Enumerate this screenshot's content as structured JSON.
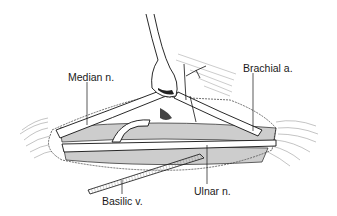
{
  "figure": {
    "type": "anatomical illustration",
    "style": "black-and-white line drawing",
    "labels": {
      "median_nerve": "Median n.",
      "brachial_artery": "Brachial a.",
      "basilic_vein": "Basilic v.",
      "ulnar_nerve": "Ulnar n."
    },
    "colors": {
      "background": "#ffffff",
      "ink": "#1a1a1a",
      "hatch": "#555555"
    }
  }
}
